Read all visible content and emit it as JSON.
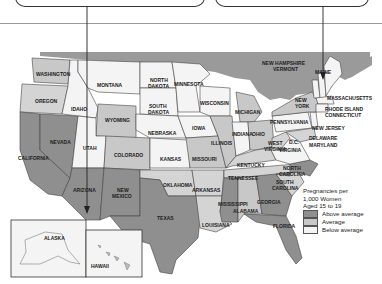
{
  "colors": {
    "above_average": "#8f8f8f",
    "average": "#c8c8c8",
    "below_average": "#f4f4f4",
    "canada": "#9a9a9a",
    "water": "#ffffff",
    "border": "#444444"
  },
  "legend": {
    "title_line1": "Pregnancies per",
    "title_line2": "1,000 Women",
    "title_line3": "Aged 15 to 19",
    "items": [
      {
        "label": "Above average",
        "category": "above"
      },
      {
        "label": "Average",
        "category": "average"
      },
      {
        "label": "Below average",
        "category": "below"
      }
    ]
  },
  "states": {
    "washington": "WASHINGTON",
    "oregon": "OREGON",
    "california": "CALIFORNIA",
    "nevada": "NEVADA",
    "idaho": "IDAHO",
    "montana": "MONTANA",
    "wyoming": "WYOMING",
    "utah": "UTAH",
    "colorado": "COLORADO",
    "arizona": "ARIZONA",
    "new_mexico_1": "NEW",
    "new_mexico_2": "MEXICO",
    "north_dakota_1": "NORTH",
    "north_dakota_2": "DAKOTA",
    "south_dakota_1": "SOUTH",
    "south_dakota_2": "DAKOTA",
    "nebraska": "NEBRASKA",
    "kansas": "KANSAS",
    "oklahoma": "OKLAHOMA",
    "texas": "TEXAS",
    "minnesota": "MINNESOTA",
    "iowa": "IOWA",
    "missouri": "MISSOURI",
    "arkansas": "ARKANSAS",
    "louisiana": "LOUISIANA",
    "wisconsin": "WISCONSIN",
    "illinois": "ILLINOIS",
    "michigan": "MICHIGAN",
    "indiana": "INDIANA",
    "ohio": "OHIO",
    "kentucky": "KENTUCKY",
    "tennessee": "TENNESSEE",
    "mississippi": "MISSISSIPPI",
    "alabama": "ALABAMA",
    "georgia": "GEORGIA",
    "florida": "FLORIDA",
    "south_carolina_1": "SOUTH",
    "south_carolina_2": "CAROLINA",
    "north_carolina_1": "NORTH",
    "north_carolina_2": "CAROLINA",
    "virginia": "VIRGINIA",
    "west_virginia_1": "WEST",
    "west_virginia_2": "VIRGINIA",
    "dc": "D.C.",
    "maryland": "MARYLAND",
    "delaware": "DELAWARE",
    "new_jersey": "NEW JERSEY",
    "pennsylvania": "PENNSYLVANIA",
    "new_york_1": "NEW",
    "new_york_2": "YORK",
    "connecticut": "CONNECTICUT",
    "rhode_island": "RHODE ISLAND",
    "massachusetts": "MASSACHUSETTS",
    "new_hampshire": "NEW HAMPSHIRE",
    "vermont": "VERMONT",
    "maine": "MAINE",
    "alaska": "ALASKA",
    "hawaii": "HAWAII"
  }
}
